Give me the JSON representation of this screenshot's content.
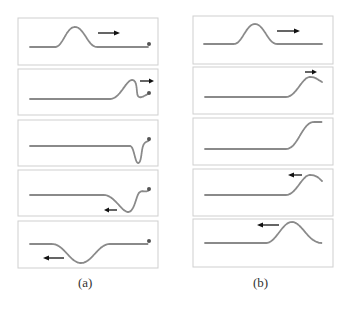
{
  "figure": {
    "columns": [
      {
        "id": "a",
        "caption": "(a)",
        "description": "Pulse on a string with a fixed end: reflected pulse is inverted",
        "panels": [
          {
            "frame": 1,
            "pulse": "upward hump at center",
            "arrow": "right",
            "end": "fixed"
          },
          {
            "frame": 2,
            "pulse": "upward hump reaching right end, folding",
            "arrow": "right",
            "end": "fixed"
          },
          {
            "frame": 3,
            "pulse": "narrow inverted dip at right end",
            "arrow": "none",
            "end": "fixed"
          },
          {
            "frame": 4,
            "pulse": "inverted dip moving away from end",
            "arrow": "left",
            "end": "fixed"
          },
          {
            "frame": 5,
            "pulse": "inverted trough at center",
            "arrow": "left",
            "end": "fixed"
          }
        ]
      },
      {
        "id": "b",
        "caption": "(b)",
        "description": "Pulse on a string with a free end: reflected pulse is upright",
        "panels": [
          {
            "frame": 1,
            "pulse": "upward hump at center",
            "arrow": "right",
            "end": "free"
          },
          {
            "frame": 2,
            "pulse": "upward hump reaching right end",
            "arrow": "right",
            "end": "free"
          },
          {
            "frame": 3,
            "pulse": "raised step at right end",
            "arrow": "none",
            "end": "free"
          },
          {
            "frame": 4,
            "pulse": "upward hump leaving end",
            "arrow": "left",
            "end": "free"
          },
          {
            "frame": 5,
            "pulse": "upward hump moving left",
            "arrow": "left",
            "end": "free"
          }
        ]
      }
    ]
  }
}
